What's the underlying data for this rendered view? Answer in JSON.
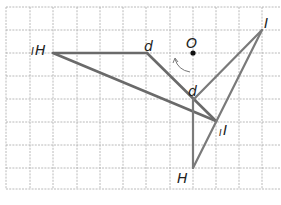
{
  "diagram": {
    "type": "geometry-rotation-grid",
    "grid": {
      "left": 6,
      "top": 7,
      "right": 281,
      "bottom": 189,
      "cell": 23.3,
      "color": "#9a9a9a"
    },
    "point_O": {
      "label": "O",
      "x": 193,
      "y": 53
    },
    "vertices": {
      "H": {
        "label": "H",
        "prefix": "I",
        "x": 53,
        "y": 53
      },
      "d": {
        "label": "d",
        "prefix": "I",
        "x": 147,
        "y": 53
      },
      "I1": {
        "label": "I",
        "x": 216,
        "y": 122,
        "prefix": "II"
      },
      "d2": {
        "label": "d",
        "x": 193,
        "y": 100
      },
      "I2": {
        "label": "I",
        "x": 262,
        "y": 30
      },
      "H2": {
        "label": "H",
        "x": 193,
        "y": 168
      }
    },
    "labels": {
      "H_left": "H",
      "H_left_tick": "I",
      "d_top": "d",
      "O": "O",
      "I_right": "I",
      "d_mid": "d",
      "I_lower": "I",
      "I_lower_tick": "I",
      "H_bottom": "H"
    },
    "line_color": "#6e6e6e",
    "rotation_arrow": "counterclockwise-arc"
  }
}
